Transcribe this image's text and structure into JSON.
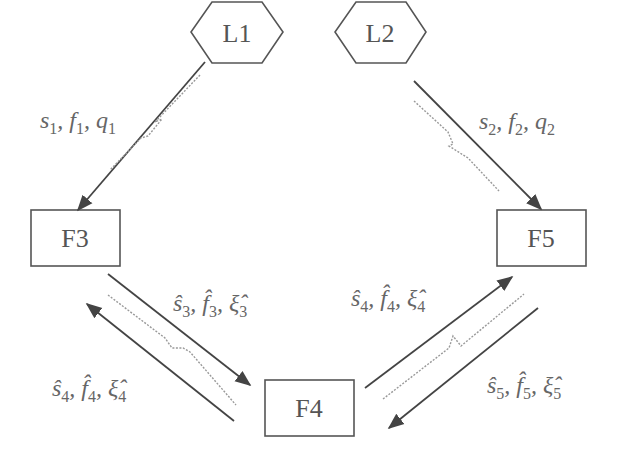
{
  "nodes": {
    "L1": {
      "label": "L1",
      "shape": "hexagon"
    },
    "L2": {
      "label": "L2",
      "shape": "hexagon"
    },
    "F3": {
      "label": "F3",
      "shape": "rectangle"
    },
    "F4": {
      "label": "F4",
      "shape": "rectangle"
    },
    "F5": {
      "label": "F5",
      "shape": "rectangle"
    }
  },
  "edges": [
    {
      "from": "L1",
      "to": "F3",
      "label": {
        "s": "s",
        "s_sub": "1",
        "f": "f",
        "f_sub": "1",
        "q": "q",
        "q_sub": "1",
        "text": "s1, f1, q1"
      },
      "wireless": true
    },
    {
      "from": "L2",
      "to": "F5",
      "label": {
        "s": "s",
        "s_sub": "2",
        "f": "f",
        "f_sub": "2",
        "q": "q",
        "q_sub": "2",
        "text": "s2, f2, q2"
      },
      "wireless": true
    },
    {
      "from": "F3",
      "to": "F4",
      "label": {
        "s": "ŝ",
        "s_sub": "3",
        "f": "f̂",
        "f_sub": "3",
        "q": "ξ̂",
        "q_sub": "3",
        "text": "ŝ3, f̂3, ξ̂3"
      },
      "wireless": true
    },
    {
      "from": "F4",
      "to": "F3",
      "label": {
        "s": "ŝ",
        "s_sub": "4",
        "f": "f̂",
        "f_sub": "4",
        "q": "ξ̂",
        "q_sub": "4",
        "text": "ŝ4, f̂4, ξ̂4"
      }
    },
    {
      "from": "F4",
      "to": "F5",
      "label": {
        "s": "ŝ",
        "s_sub": "4",
        "f": "f̂",
        "f_sub": "4",
        "q": "ξ̂",
        "q_sub": "4",
        "text": "ŝ4, f̂4, ξ̂4"
      },
      "wireless": true
    },
    {
      "from": "F5",
      "to": "F4",
      "label": {
        "s": "ŝ",
        "s_sub": "5",
        "f": "f̂",
        "f_sub": "5",
        "q": "ξ̂",
        "q_sub": "5",
        "text": "ŝ5, f̂5, ξ̂5"
      }
    }
  ],
  "colors": {
    "stroke": "#555555",
    "text": "#666666",
    "link": "#999999"
  }
}
